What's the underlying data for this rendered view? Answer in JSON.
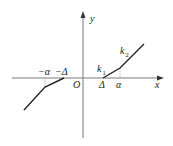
{
  "diagram": {
    "labels": {
      "y_axis": "y",
      "x_axis": "x",
      "origin": "O",
      "delta_pos": "Δ",
      "alpha_pos": "α",
      "delta_neg": "−Δ",
      "alpha_neg": "−α",
      "slope1": "k",
      "slope1_sub": "1",
      "slope2": "k",
      "slope2_sub": "2"
    },
    "colors": {
      "axis": "#7a7a7a",
      "curve": "#222222",
      "text": "#222222"
    }
  }
}
